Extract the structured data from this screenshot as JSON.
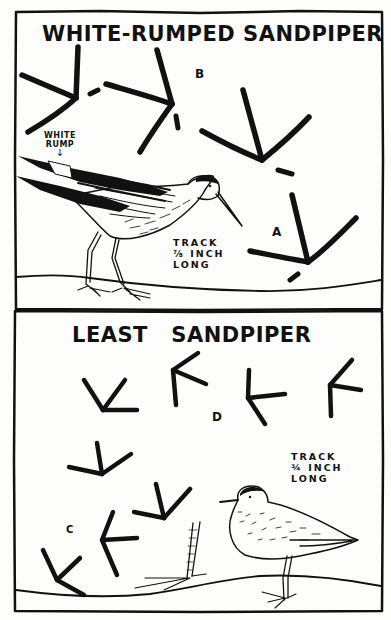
{
  "plate": {
    "panels": [
      {
        "title": "WHITE-RUMPED SANDPIPER",
        "bird_label": "WHITE\nRUMP",
        "bird_label_lines": [
          "WHITE",
          "RUMP"
        ],
        "arrow_glyph": "↓",
        "track_note_lines": [
          "TRACK",
          "⅞ INCH",
          "LONG"
        ],
        "track_letters": [
          "B",
          "A"
        ]
      },
      {
        "title": "LEAST   SANDPIPER",
        "track_note_lines": [
          "TRACK",
          "¾ INCH",
          "LONG"
        ],
        "track_letters": [
          "D",
          "C"
        ]
      }
    ]
  },
  "colors": {
    "ink": "#111111",
    "paper": "#fdfdfb"
  }
}
